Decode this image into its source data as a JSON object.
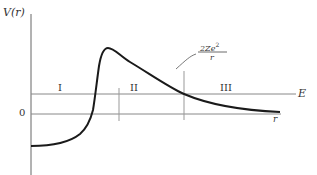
{
  "diagram": {
    "type": "potential-energy-curve",
    "y_axis_label": "V(r)",
    "x_axis_label": "r",
    "zero_label": "0",
    "energy_line_label": "E",
    "regions": [
      {
        "id": "I",
        "label": "I"
      },
      {
        "id": "II",
        "label": "II"
      },
      {
        "id": "III",
        "label": "III"
      }
    ],
    "annotation": {
      "numerator": "2Ze",
      "superscript": "2",
      "denominator": "r"
    },
    "colors": {
      "curve": "#1a1a1a",
      "axes": "#555555",
      "lines": "#888888",
      "text": "#333333"
    }
  }
}
